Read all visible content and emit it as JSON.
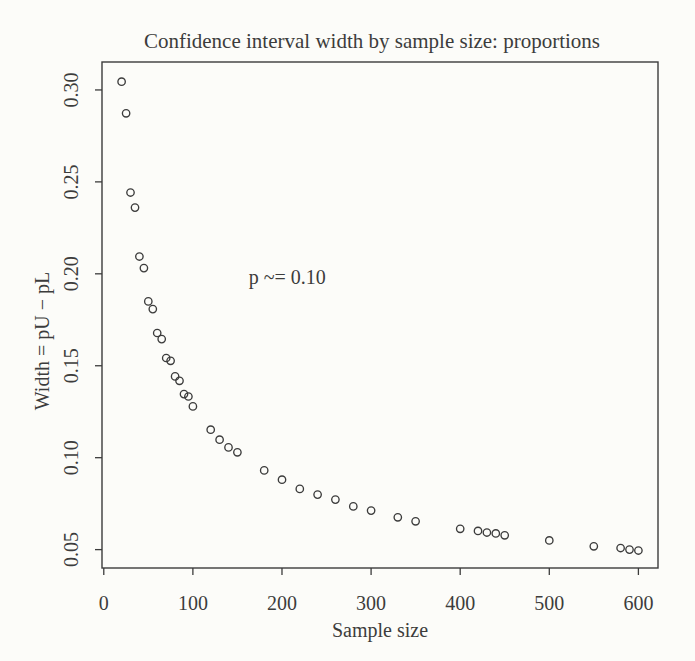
{
  "figure": {
    "background": "#fcfcf9",
    "ink_color": "#3c3c3c"
  },
  "chart_data": {
    "type": "scatter",
    "title": "Confidence interval width by sample size: proportions",
    "xlabel": "Sample size",
    "ylabel": "Width = pU − pL",
    "annotation": {
      "text": "p ~= 0.10",
      "x": 206,
      "y": 0.198
    },
    "marker": "open-circle",
    "grid": false,
    "legend": "none",
    "xlim": [
      -2,
      622
    ],
    "ylim": [
      0.04,
      0.3152
    ],
    "xticks": [
      0,
      100,
      200,
      300,
      400,
      500,
      600
    ],
    "yticks": [
      0.05,
      0.1,
      0.15,
      0.2,
      0.25,
      0.3
    ],
    "x": [
      20,
      25,
      30,
      35,
      40,
      45,
      50,
      55,
      60,
      65,
      70,
      75,
      80,
      85,
      90,
      95,
      100,
      120,
      130,
      140,
      150,
      180,
      200,
      220,
      240,
      260,
      280,
      300,
      330,
      350,
      400,
      420,
      430,
      440,
      450,
      500,
      550,
      580,
      590,
      600
    ],
    "y": [
      0.3045,
      0.2873,
      0.2442,
      0.236,
      0.2094,
      0.2031,
      0.185,
      0.1808,
      0.1678,
      0.1645,
      0.1542,
      0.1527,
      0.1442,
      0.1418,
      0.1346,
      0.1333,
      0.1279,
      0.1152,
      0.1098,
      0.1056,
      0.1029,
      0.0931,
      0.088,
      0.083,
      0.0799,
      0.0772,
      0.0735,
      0.0712,
      0.0676,
      0.0654,
      0.0613,
      0.0602,
      0.0593,
      0.0588,
      0.0578,
      0.055,
      0.0518,
      0.0509,
      0.05,
      0.0495
    ]
  }
}
